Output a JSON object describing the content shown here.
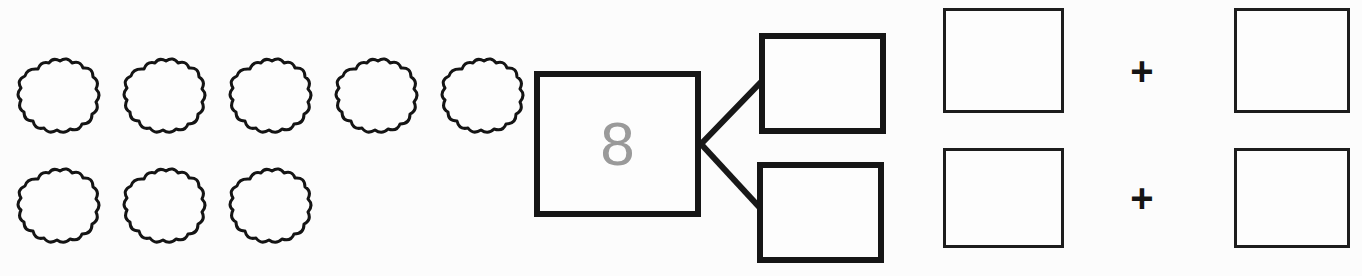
{
  "worksheet": {
    "type": "number-bond-decomposition",
    "background_color": "#fcfcfc",
    "ink_color": "#161616"
  },
  "counters": {
    "icon": "cloud-icon",
    "total_count": 8,
    "rows": [
      {
        "count": 5,
        "items": [
          "cloud-1",
          "cloud-2",
          "cloud-3",
          "cloud-4",
          "cloud-5"
        ]
      },
      {
        "count": 3,
        "items": [
          "cloud-6",
          "cloud-7",
          "cloud-8"
        ]
      }
    ]
  },
  "number_bond": {
    "whole": {
      "value": "8",
      "value_color": "#9a9a9a",
      "filled": true
    },
    "parts": [
      {
        "position": "top",
        "value": "",
        "filled": false
      },
      {
        "position": "bottom",
        "value": "",
        "filled": false
      }
    ],
    "connector": "branch-lines"
  },
  "equations": {
    "operator": "+",
    "rows": [
      {
        "left": {
          "value": "",
          "filled": false
        },
        "operator": "+",
        "right": {
          "value": "",
          "filled": false
        }
      },
      {
        "left": {
          "value": "",
          "filled": false
        },
        "operator": "+",
        "right": {
          "value": "",
          "filled": false
        }
      }
    ]
  }
}
